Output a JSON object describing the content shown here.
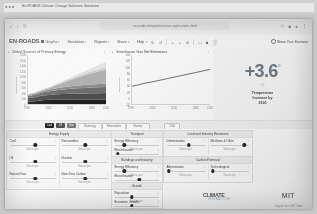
{
  "window": {
    "os_title": "En-ROADS Climate Change Solutions Simulator"
  },
  "browser": {
    "back_icon": "back-arrow-icon",
    "forward_icon": "forward-arrow-icon",
    "reload_icon": "reload-icon",
    "url": "en-roads.climateinteractive.org/scenario.html",
    "bookmark_icon": "star-icon",
    "extensions_icon": "puzzle-icon",
    "profile_icon": "profile-icon",
    "menu_icon": "kebab-menu-icon"
  },
  "toolbar": {
    "brand": "EN-ROADS",
    "menus": [
      {
        "label": "Graphs",
        "caret": "▾",
        "icon": "grid-icon"
      },
      {
        "label": "Simulation",
        "caret": "▾"
      },
      {
        "label": "Reports",
        "caret": "▾"
      },
      {
        "label": "Share",
        "caret": "▾"
      },
      {
        "label": "Help",
        "caret": "▾"
      }
    ],
    "icons": [
      "undo-icon",
      "redo-icon",
      "zoom-out-icon",
      "zoom-in-icon",
      "reset-icon",
      "compare-icon",
      "layout-icon",
      "info-icon"
    ],
    "share_label": "Share Your Scenario"
  },
  "charts": [
    {
      "title": "Global Sources of Primary Energy",
      "menu_icon": "chart-menu-icon",
      "chart_data": {
        "type": "area",
        "title": "Global Sources of Primary Energy",
        "xlabel": "",
        "ylabel": "Exajoules/year",
        "x": [
          1990,
          2000,
          2010,
          2020,
          2030,
          2040,
          2050,
          2060,
          2070,
          2080,
          2090,
          2100
        ],
        "xlim": [
          1990,
          2100
        ],
        "ylim": [
          0,
          1800
        ],
        "yticks": [
          0,
          200,
          400,
          600,
          800,
          1000,
          1200,
          1400,
          1600,
          1800
        ],
        "xticks": [
          1990,
          2020,
          2050,
          2080,
          2100
        ],
        "grid": false,
        "legend": "bottom",
        "series": [
          {
            "name": "Coal",
            "color": "#1c1c1c",
            "values": [
              92,
              100,
              140,
              155,
              160,
              162,
              163,
              164,
              165,
              166,
              167,
              168
            ]
          },
          {
            "name": "Oil",
            "color": "#4a4a4a",
            "values": [
              130,
              150,
              170,
              180,
              195,
              205,
              212,
              218,
              222,
              226,
              230,
              233
            ]
          },
          {
            "name": "Natural Gas",
            "color": "#6e6e6e",
            "values": [
              70,
              88,
              110,
              130,
              150,
              168,
              182,
              194,
              204,
              212,
              219,
              225
            ]
          },
          {
            "name": "Bioenergy",
            "color": "#8f8f8f",
            "values": [
              40,
              48,
              56,
              64,
              74,
              84,
              93,
              101,
              108,
              114,
              120,
              125
            ]
          },
          {
            "name": "Renewables",
            "color": "#b4b4b4",
            "values": [
              10,
              16,
              30,
              58,
              110,
              170,
              235,
              300,
              360,
              415,
              465,
              510
            ]
          },
          {
            "name": "Nuclear",
            "color": "#d2d2d2",
            "values": [
              22,
              26,
              28,
              30,
              36,
              42,
              48,
              54,
              60,
              66,
              72,
              78
            ]
          },
          {
            "name": "New Zero Carbon",
            "color": "#e8e8e8",
            "values": [
              0,
              0,
              0,
              2,
              8,
              20,
              38,
              60,
              88,
              120,
              158,
              200
            ]
          }
        ]
      }
    },
    {
      "title": "Greenhouse Gas Net Emissions",
      "menu_icon": "chart-menu-icon",
      "chart_data": {
        "type": "line",
        "title": "Greenhouse Gas Net Emissions",
        "xlabel": "",
        "ylabel": "GtCO2e/year",
        "x": [
          1990,
          2000,
          2010,
          2020,
          2030,
          2040,
          2050,
          2060,
          2070,
          2080,
          2090,
          2100
        ],
        "xlim": [
          1990,
          2100
        ],
        "ylim": [
          -20,
          140
        ],
        "yticks": [
          -20,
          0,
          20,
          40,
          60,
          80,
          100,
          120,
          140
        ],
        "xticks": [
          1990,
          2020,
          2050,
          2080,
          2100
        ],
        "grid": false,
        "legend": "none",
        "series": [
          {
            "name": "Baseline",
            "color": "#3a3a3a",
            "values": [
              38,
              43,
              49,
              53,
              58,
              63,
              68,
              73,
              78,
              83,
              88,
              93
            ]
          }
        ]
      }
    }
  ],
  "metric": {
    "value": "+3.6",
    "degree": "°",
    "unit": "°C",
    "caption_line1": "Temperature",
    "caption_line2": "Increase by",
    "caption_line3": "2100"
  },
  "scenario_legend": {
    "tags": [
      {
        "label": "Coal",
        "color": "#1f1f1f",
        "filled": true
      },
      {
        "label": "Oil",
        "color": "#4f4f4f",
        "filled": true
      },
      {
        "label": "Gas",
        "color": "#7a7a7a",
        "filled": true
      },
      {
        "label": "Bioenergy",
        "filled": false
      },
      {
        "label": "Renewables",
        "filled": false
      },
      {
        "label": "Nuclear",
        "filled": false
      }
    ],
    "marker_label": "2100"
  },
  "control_groups": [
    {
      "title": "Energy Supply",
      "sliders": [
        {
          "name": "Coal",
          "info": "i",
          "value": "Status quo",
          "pos": 56
        },
        {
          "name": "Renewables",
          "info": "i",
          "value": "Status quo",
          "pos": 52
        },
        {
          "name": "Oil",
          "info": "i",
          "value": "Status quo",
          "pos": 56
        },
        {
          "name": "Nuclear",
          "info": "i",
          "value": "Status quo",
          "pos": 52
        },
        {
          "name": "Natural Gas",
          "info": "i",
          "value": "Status quo",
          "pos": 56
        },
        {
          "name": "New Zero Carbon",
          "info": "i",
          "value": "Status quo",
          "pos": 52
        }
      ]
    },
    {
      "title": "Transport",
      "sliders": [
        {
          "name": "Energy Efficiency",
          "info": "i",
          "value": "Status quo",
          "pos": 24
        },
        {
          "name": "Electrification",
          "info": "i",
          "value": "Status quo",
          "pos": 10
        }
      ]
    },
    {
      "title": "Buildings and Industry",
      "sliders": [
        {
          "name": "Energy Efficiency",
          "info": "i",
          "value": "Status quo",
          "pos": 24
        },
        {
          "name": "Electrification",
          "info": "i",
          "value": "Status quo",
          "pos": 56
        }
      ]
    },
    {
      "title": "Growth",
      "sliders": [
        {
          "name": "Population",
          "info": "i",
          "value": "Status quo",
          "pos": 40
        },
        {
          "name": "Economic Growth",
          "info": "i",
          "value": "Status quo",
          "pos": 40
        }
      ]
    },
    {
      "title": "Land and Industry Emissions",
      "sliders": [
        {
          "name": "Deforestation",
          "info": "i",
          "value": "Status quo",
          "pos": 58
        },
        {
          "name": "Methane & Other",
          "info": "i",
          "value": "Status quo",
          "pos": 86
        }
      ]
    },
    {
      "title": "Carbon Removal",
      "sliders": [
        {
          "name": "Afforestation",
          "info": "i",
          "value": "Status quo",
          "pos": 10
        },
        {
          "name": "Technological",
          "info": "i",
          "value": "Status quo",
          "pos": 10
        }
      ]
    }
  ],
  "logos": {
    "climate_interactive": "CLIMATE",
    "climate_interactive_sub": "INTERACTIVE",
    "mit": "MIT",
    "credit": "Support for in MIT Sloan"
  }
}
